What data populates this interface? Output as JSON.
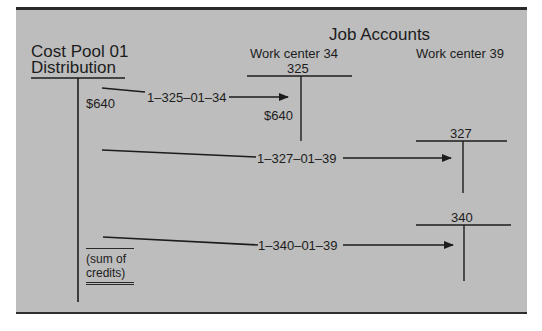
{
  "diagram": {
    "source": {
      "title_line1": "Cost Pool 01",
      "title_line2": "Distribution",
      "amount": "$640",
      "total_label_line1": "(sum of",
      "total_label_line2": "credits)"
    },
    "job_accounts": {
      "title": "Job Accounts",
      "work_centers": [
        {
          "label": "Work center 34",
          "accounts": [
            {
              "number": "325",
              "amount": "$640"
            }
          ]
        },
        {
          "label": "Work center 39",
          "accounts": [
            {
              "number": "327"
            },
            {
              "number": "340"
            }
          ]
        }
      ]
    },
    "transfers": [
      {
        "code": "1–325–01–34",
        "to": "325"
      },
      {
        "code": "1–327–01–39",
        "to": "327"
      },
      {
        "code": "1–340–01–39",
        "to": "340"
      }
    ],
    "colors": {
      "panel": "#bdbdbd",
      "ink": "#1c1c1c",
      "border": "#2a2a2a"
    }
  }
}
